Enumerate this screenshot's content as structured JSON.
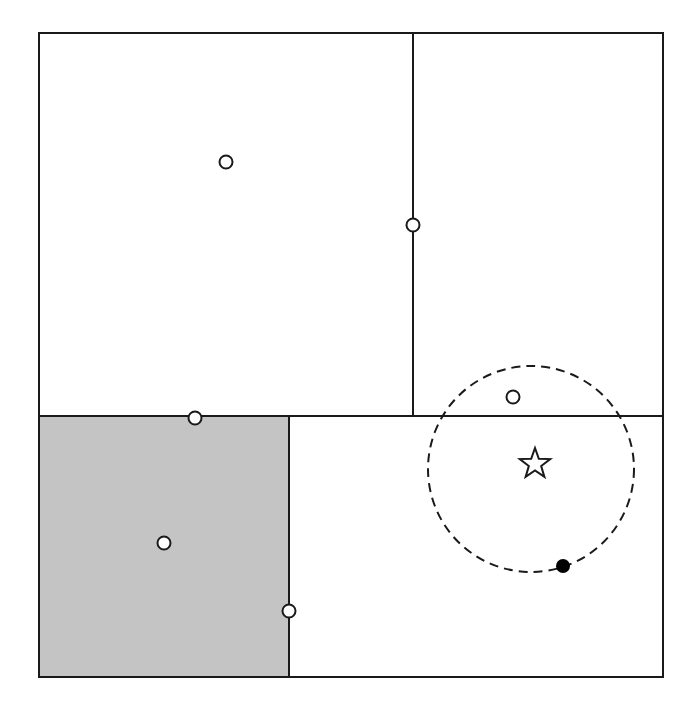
{
  "diagram": {
    "width": 697,
    "height": 708,
    "colors": {
      "line": "#1a1a1a",
      "shaded_region": "#c4c4c4",
      "background": "#ffffff",
      "open_marker_fill": "#ffffff",
      "filled_marker": "#000000"
    },
    "outer_box": {
      "x1": 39,
      "y1": 33,
      "x2": 663,
      "y2": 677
    },
    "regions": [
      {
        "name": "top-left-region",
        "x1": 39,
        "y1": 33,
        "x2": 413,
        "y2": 416,
        "shaded": false
      },
      {
        "name": "top-right-region",
        "x1": 413,
        "y1": 33,
        "x2": 663,
        "y2": 416,
        "shaded": false
      },
      {
        "name": "bottom-left-region",
        "x1": 40,
        "y1": 416,
        "x2": 289,
        "y2": 677,
        "shaded": true
      },
      {
        "name": "bottom-right-region",
        "x1": 289,
        "y1": 416,
        "x2": 663,
        "y2": 677,
        "shaded": false
      }
    ],
    "dividers": [
      {
        "name": "vertical-divider-top",
        "x1": 413,
        "y1": 33,
        "x2": 413,
        "y2": 416
      },
      {
        "name": "horizontal-divider",
        "x1": 39,
        "y1": 416,
        "x2": 663,
        "y2": 416
      },
      {
        "name": "vertical-divider-bottom",
        "x1": 289,
        "y1": 416,
        "x2": 289,
        "y2": 677
      }
    ],
    "open_points": [
      {
        "name": "point-top-left-center",
        "cx": 226,
        "cy": 162,
        "r": 6.5
      },
      {
        "name": "point-on-vertical-divider",
        "cx": 413,
        "cy": 225,
        "r": 6.5
      },
      {
        "name": "point-on-horizontal-divider",
        "cx": 195,
        "cy": 418,
        "r": 6.5
      },
      {
        "name": "point-shaded-region-center",
        "cx": 164,
        "cy": 543,
        "r": 6.5
      },
      {
        "name": "point-on-bottom-divider",
        "cx": 289,
        "cy": 611,
        "r": 6.5
      },
      {
        "name": "point-inside-dashed-circle",
        "cx": 513,
        "cy": 397,
        "r": 6.5
      }
    ],
    "filled_point": {
      "name": "point-on-dashed-circle",
      "cx": 563,
      "cy": 566,
      "r": 7
    },
    "dashed_circle": {
      "cx": 531,
      "cy": 469,
      "r": 103,
      "dash": "9 6"
    },
    "star": {
      "cx": 535,
      "cy": 464,
      "outer_r": 16,
      "inner_r": 6.5
    }
  }
}
